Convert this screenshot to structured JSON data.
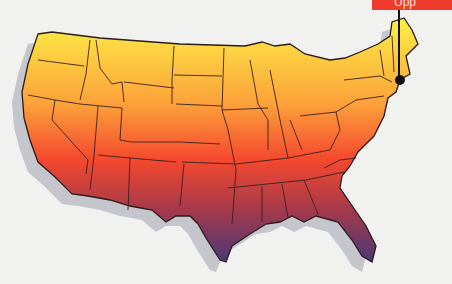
{
  "map": {
    "title": "United States",
    "type": "choropleth-gradient",
    "gradient": {
      "direction": "north-to-south",
      "stops": [
        {
          "offset": "0%",
          "color": "#fcf046"
        },
        {
          "offset": "35%",
          "color": "#fca23a"
        },
        {
          "offset": "58%",
          "color": "#f5482e"
        },
        {
          "offset": "78%",
          "color": "#a83a4a"
        },
        {
          "offset": "100%",
          "color": "#4a3878"
        }
      ]
    },
    "border_color": "#2a1a1a",
    "shadow_color": "#c4c6cc",
    "background_color": "#f1f1f0"
  },
  "marker": {
    "label": "Upp",
    "label_bg": "#ee3b2c",
    "location": "Massachusetts",
    "dot_color": "#111111"
  }
}
